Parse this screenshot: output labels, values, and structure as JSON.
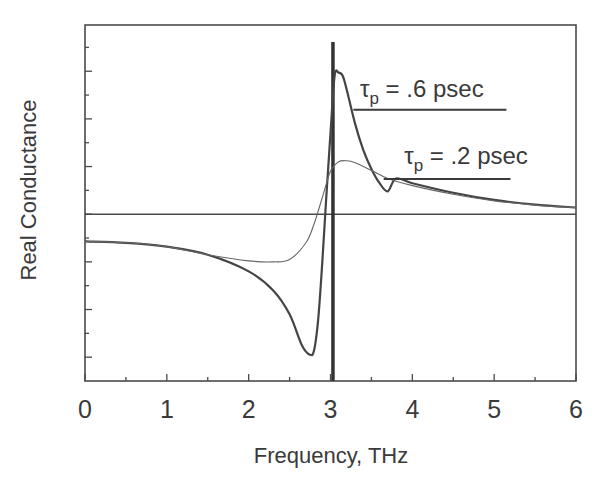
{
  "chart_data": {
    "type": "line",
    "title": "",
    "xlabel": "Frequency, THz",
    "ylabel": "Real Conductance",
    "xlim": [
      0,
      6
    ],
    "ylim": [
      -3.5,
      3.97
    ],
    "x_ticks": [
      0,
      1,
      2,
      3,
      4,
      5,
      6
    ],
    "x_tick_labels": [
      "0",
      "1",
      "2",
      "3",
      "4",
      "5",
      "6"
    ],
    "y_tick_labels": [],
    "grid": false,
    "legend": "none",
    "reference_lines": {
      "zero_line_y": 0,
      "resonance_vertical_x": 3.03
    },
    "series": [
      {
        "name": "τp = .6 psec",
        "x": [
          0,
          0.5,
          1.0,
          1.5,
          2.0,
          2.3,
          2.5,
          2.65,
          2.75,
          2.8,
          2.85,
          2.9,
          2.95,
          3.0,
          3.05,
          3.1,
          3.15,
          3.2,
          3.3,
          3.4,
          3.5,
          3.6,
          3.7,
          3.8,
          4.0,
          4.5,
          5.0,
          5.5,
          6.0
        ],
        "y": [
          -0.57,
          -0.6,
          -0.68,
          -0.85,
          -1.2,
          -1.6,
          -2.1,
          -2.75,
          -2.95,
          -2.85,
          -2.2,
          -1.0,
          0.4,
          1.7,
          2.9,
          2.97,
          2.9,
          2.6,
          1.9,
          1.35,
          0.95,
          0.65,
          0.48,
          0.75,
          0.65,
          0.45,
          0.3,
          0.2,
          0.14
        ],
        "note": "sharp curve; derived by tracing (y in tick units, zero line = 0)"
      },
      {
        "name": "τp = .2 psec",
        "x": [
          0,
          0.5,
          1.0,
          1.5,
          2.0,
          2.3,
          2.5,
          2.7,
          2.8,
          2.9,
          3.0,
          3.1,
          3.2,
          3.3,
          3.5,
          3.7,
          4.0,
          4.5,
          5.0,
          5.5,
          6.0
        ],
        "y": [
          -0.57,
          -0.6,
          -0.68,
          -0.85,
          -0.98,
          -1.0,
          -0.95,
          -0.6,
          -0.2,
          0.35,
          0.9,
          1.1,
          1.12,
          1.08,
          0.92,
          0.75,
          0.6,
          0.42,
          0.28,
          0.19,
          0.14
        ],
        "note": "broad curve"
      }
    ],
    "annotations": [
      {
        "text_main": "τ",
        "text_sub": "p",
        "text_rest": " = .6 psec",
        "x": 3.36,
        "y": 2.45,
        "underline_from": 3.28,
        "underline_to": 5.15,
        "underline_y": 2.19
      },
      {
        "text_main": "τ",
        "text_sub": "p",
        "text_rest": " = .2 psec",
        "x": 3.9,
        "y": 1.05,
        "underline_from": 3.65,
        "underline_to": 5.2,
        "underline_y": 0.74
      }
    ]
  }
}
